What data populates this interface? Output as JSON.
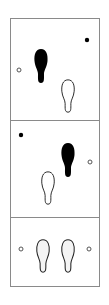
{
  "diagram": {
    "type": "footstep-sequence",
    "colors": {
      "frame": "#8a8a8a",
      "filled": "#000000",
      "outline": "#222222",
      "background": "#ffffff"
    },
    "panels": [
      {
        "index": 1,
        "markers": [
          {
            "kind": "open-circle",
            "x": 19,
            "y": 70
          },
          {
            "kind": "filled-dot",
            "x": 87,
            "y": 40
          }
        ],
        "footprints": [
          {
            "style": "filled",
            "x": 41,
            "y": 66
          },
          {
            "style": "outline",
            "x": 68,
            "y": 96
          }
        ]
      },
      {
        "index": 2,
        "markers": [
          {
            "kind": "filled-dot",
            "x": 21,
            "y": 135
          },
          {
            "kind": "open-circle",
            "x": 90,
            "y": 162
          }
        ],
        "footprints": [
          {
            "style": "filled",
            "x": 68,
            "y": 160
          },
          {
            "style": "outline",
            "x": 48,
            "y": 188
          }
        ]
      },
      {
        "index": 3,
        "markers": [
          {
            "kind": "open-circle",
            "x": 21,
            "y": 249
          },
          {
            "kind": "open-circle",
            "x": 89,
            "y": 249
          }
        ],
        "footprints": [
          {
            "style": "dotted-outline",
            "x": 43,
            "y": 256
          },
          {
            "style": "dotted-outline",
            "x": 68,
            "y": 256
          }
        ]
      }
    ]
  }
}
